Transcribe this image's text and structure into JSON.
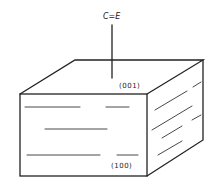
{
  "diagram": {
    "axis_label": "C=E",
    "top_face_label": "(001)",
    "front_face_label": "(100)",
    "line_color": "#222222"
  }
}
